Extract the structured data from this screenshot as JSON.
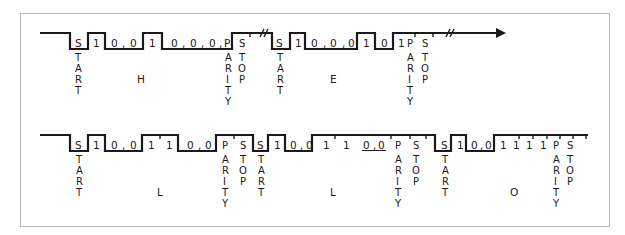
{
  "diagram": {
    "type": "asynchronous serial transmission timing diagram",
    "frame_border_color": "#b8b8b8",
    "line_color": "#1a1a1a",
    "rows": [
      {
        "id": "row1",
        "characters": [
          {
            "char": "H",
            "start_label": "START",
            "bits": [
              "1",
              "0",
              ",",
              "0",
              "1",
              "0",
              ",",
              "0",
              ",",
              "0",
              ","
            ],
            "parity_bit": "P",
            "parity_label": "PARITY",
            "stop_label": "STOP"
          },
          {
            "char": "E",
            "start_label": "START",
            "bits": [
              "1",
              "0",
              ",",
              "0",
              ",",
              "0",
              "1",
              "0",
              "1"
            ],
            "parity_label": "PARITY",
            "stop_label": "STOP"
          }
        ],
        "break_symbols": [
          "//",
          "//"
        ],
        "ends_with_arrow": true
      },
      {
        "id": "row2",
        "characters": [
          {
            "char": "L",
            "start_label": "START",
            "bits": [
              "1",
              "0",
              ",",
              "0",
              "1",
              "1",
              "0",
              ",",
              "0"
            ],
            "parity_label": "PARITY",
            "stop_label": "STOP"
          },
          {
            "char": "L",
            "start_label": "START",
            "bits": [
              "1",
              "0",
              ",",
              "0",
              "1",
              "1",
              "0",
              ",",
              "0"
            ],
            "parity_label": "PARITY",
            "stop_label": "STOP"
          },
          {
            "char": "O",
            "start_label": "START",
            "bits": [
              "1",
              "0",
              ",",
              "0",
              "1",
              "1",
              "1",
              "1"
            ],
            "parity_label": "PARITY",
            "stop_label": "STOP"
          }
        ],
        "ends_with_arrow": false
      }
    ],
    "text": {
      "start_s": "S",
      "start_rest": [
        "T",
        "A",
        "R",
        "T"
      ],
      "parity": [
        "P",
        "A",
        "R",
        "I",
        "T",
        "Y"
      ],
      "stop": [
        "S",
        "T",
        "O",
        "P"
      ],
      "one": "1",
      "zero": "0",
      "comma": ",",
      "p": "P",
      "break": "//",
      "char_h": "H",
      "char_e": "E",
      "char_l": "L",
      "char_o": "O"
    }
  }
}
